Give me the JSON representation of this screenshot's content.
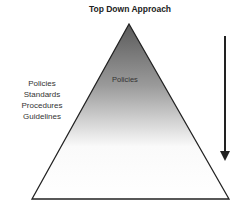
{
  "title": "Top Down Approach",
  "pyramid": {
    "inner_label": "Policies",
    "gradient": {
      "top_color": "#5a5a5a",
      "bottom_color": "#ffffff"
    }
  },
  "side_list": [
    "Policies",
    "Standards",
    "Procedures",
    "Guidelines"
  ],
  "arrow": {
    "direction": "down",
    "color": "#222222"
  }
}
